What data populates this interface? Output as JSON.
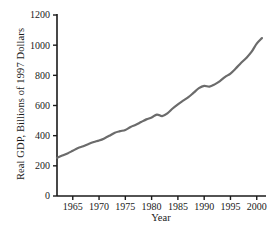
{
  "chart_data": {
    "type": "line",
    "title": "",
    "xlabel": "Year",
    "ylabel": "Real GDP, Billions of 1997 Dollars",
    "xlim": [
      1962,
      2001
    ],
    "ylim": [
      0,
      1200
    ],
    "xticks": [
      1965,
      1970,
      1975,
      1980,
      1985,
      1990,
      1995,
      2000
    ],
    "yticks": [
      0,
      200,
      400,
      600,
      800,
      1000,
      1200
    ],
    "xtick_labels": [
      "1965",
      "1970",
      "1975",
      "1980",
      "1985",
      "1990",
      "1995",
      "2000"
    ],
    "ytick_labels": [
      "0",
      "200",
      "400",
      "600",
      "800",
      "1000",
      "1200"
    ],
    "grid": false,
    "legend": null,
    "line_color": "#6b6b6b",
    "line_width": 2.2,
    "series": [
      {
        "name": "Real GDP",
        "x": [
          1962,
          1963,
          1964,
          1965,
          1966,
          1967,
          1968,
          1969,
          1970,
          1971,
          1972,
          1973,
          1974,
          1975,
          1976,
          1977,
          1978,
          1979,
          1980,
          1981,
          1982,
          1983,
          1984,
          1985,
          1986,
          1987,
          1988,
          1989,
          1990,
          1991,
          1992,
          1993,
          1994,
          1995,
          1996,
          1997,
          1998,
          1999,
          2000,
          2001
        ],
        "y": [
          253,
          268,
          282,
          300,
          318,
          330,
          345,
          358,
          368,
          382,
          400,
          420,
          430,
          438,
          458,
          472,
          490,
          508,
          520,
          540,
          530,
          548,
          580,
          608,
          632,
          655,
          685,
          715,
          730,
          725,
          740,
          762,
          790,
          812,
          845,
          882,
          915,
          955,
          1010,
          1047
        ]
      }
    ]
  },
  "axes": {
    "left_spine": true,
    "bottom_spine": true,
    "top_spine": false,
    "right_spine": false,
    "tick_direction": "out"
  }
}
